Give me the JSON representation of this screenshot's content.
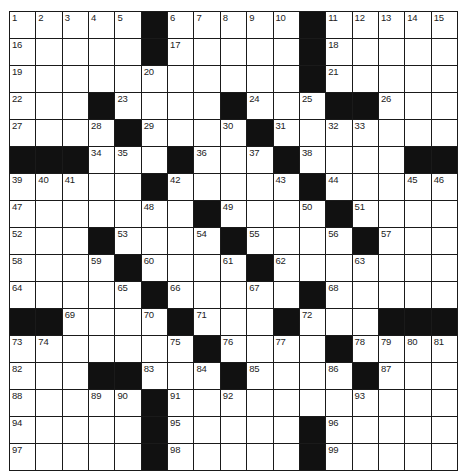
{
  "puzzle": {
    "rows": 17,
    "cols": 17,
    "colors": {
      "block": "#111111",
      "cell": "#ffffff",
      "line": "#1a1a1a",
      "number": "#222222"
    },
    "layout": [
      "1,2,3,4,5,#,6,7,8,9,10,#,11,12,13,14,15",
      "16,.,.,.,.,#,17,.,.,.,.,#,18,.,.,.,.",
      "19,.,.,.,.,20,.,.,.,.,.,#,21,.,.,.,.",
      "22,.,.,#,23,.,.,.,#,24,.,25,#,#,26,.,.",
      "27,.,.,28,#,29,.,.,30,#,31,.,32,33,.,.,.",
      "#,#,#,34,35,.,#,36,.,37,#,38,.,.,.,#,#",
      "39,40,41,.,.,#,42,.,.,.,43,#,44,.,.,45,46",
      "47,.,.,.,.,48,.,#,49,.,.,50,#,51,.,.,.",
      "52,.,.,#,53,.,.,54,#,55,.,.,56,#,57,.,.",
      "58,.,.,59,#,60,.,.,61,#,62,.,.,63,.,.,.",
      "64,.,.,.,65,#,66,.,.,67,.,#,68,.,.,.,.",
      "#,#,69,.,.,70,#,71,.,.,#,72,.,.,#,#,#",
      "73,74,.,.,.,.,75,#,76,.,77,.,#,78,79,80,81",
      "82,.,.,#,#,83,.,84,#,85,.,.,86,#,87,.,.",
      "88,.,.,89,90,#,91,.,92,.,.,.,.,93,.,.,.",
      "94,.,.,.,.,#,95,.,.,.,.,#,96,.,.,.,.",
      "97,.,.,.,.,#,98,.,.,.,.,#,99,.,.,.,."
    ]
  }
}
